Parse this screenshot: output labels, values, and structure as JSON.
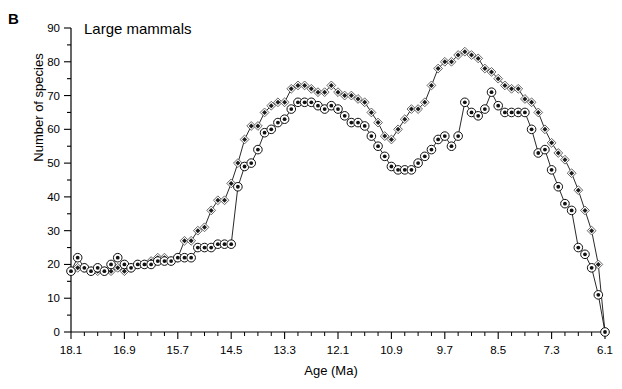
{
  "panel": {
    "label": "B"
  },
  "chart_data": {
    "type": "line",
    "title": "Large mammals",
    "xlabel": "Age (Ma)",
    "ylabel": "Number of species",
    "xlim": [
      18.1,
      6.1
    ],
    "ylim": [
      0,
      90
    ],
    "x_reversed": true,
    "grid": false,
    "legend_position": "none",
    "x_major_ticks": [
      "18.1",
      "16.9",
      "15.7",
      "14.5",
      "13.3",
      "12.1",
      "10.9",
      "9.7",
      "8.5",
      "7.3",
      "6.1"
    ],
    "x_major_values": [
      18.1,
      16.9,
      15.7,
      14.5,
      13.3,
      12.1,
      10.9,
      9.7,
      8.5,
      7.3,
      6.1
    ],
    "x_minor_step": 0.3,
    "y_major_ticks": [
      "0",
      "10",
      "20",
      "30",
      "40",
      "50",
      "60",
      "70",
      "80",
      "90"
    ],
    "y_major_values": [
      0,
      10,
      20,
      30,
      40,
      50,
      60,
      70,
      80,
      90
    ],
    "y_minor_step": 5,
    "x": [
      18.1,
      17.95,
      17.8,
      17.65,
      17.5,
      17.35,
      17.2,
      17.05,
      16.9,
      16.75,
      16.6,
      16.45,
      16.3,
      16.15,
      16.0,
      15.85,
      15.7,
      15.55,
      15.4,
      15.25,
      15.1,
      14.95,
      14.8,
      14.65,
      14.5,
      14.35,
      14.2,
      14.05,
      13.9,
      13.75,
      13.6,
      13.45,
      13.3,
      13.15,
      13.0,
      12.85,
      12.7,
      12.55,
      12.4,
      12.25,
      12.1,
      11.95,
      11.8,
      11.65,
      11.5,
      11.35,
      11.2,
      11.05,
      10.9,
      10.75,
      10.6,
      10.45,
      10.3,
      10.15,
      10.0,
      9.85,
      9.7,
      9.55,
      9.4,
      9.25,
      9.1,
      8.95,
      8.8,
      8.65,
      8.5,
      8.35,
      8.2,
      8.05,
      7.9,
      7.75,
      7.6,
      7.45,
      7.3,
      7.15,
      7.0,
      6.85,
      6.7,
      6.55,
      6.4,
      6.25,
      6.1
    ],
    "series": [
      {
        "name": "Total species (open diamond / filled diamond)",
        "marker": "diamond",
        "values": [
          18,
          19,
          19,
          18,
          18,
          18,
          18,
          19,
          18,
          19,
          20,
          20,
          21,
          22,
          22,
          21,
          22,
          27,
          27,
          30,
          31,
          36,
          39,
          39,
          44,
          50,
          57,
          61,
          61,
          65,
          67,
          68,
          68,
          72,
          73,
          73,
          72,
          71,
          71,
          73,
          71,
          70,
          70,
          69,
          68,
          65,
          62,
          58,
          57,
          60,
          63,
          66,
          66,
          68,
          73,
          78,
          80,
          80,
          82,
          83,
          82,
          81,
          78,
          77,
          75,
          73,
          72,
          72,
          69,
          68,
          65,
          60,
          56,
          53,
          51,
          47,
          42,
          36,
          30,
          20,
          0
        ]
      },
      {
        "name": "Species with minimum duration (open circle / dotted circle)",
        "marker": "circle",
        "values": [
          18,
          22,
          19,
          18,
          19,
          18,
          20,
          22,
          20,
          19,
          20,
          20,
          20,
          21,
          21,
          21,
          22,
          22,
          22,
          25,
          25,
          25,
          26,
          26,
          26,
          43,
          49,
          50,
          54,
          59,
          60,
          62,
          63,
          66,
          68,
          68,
          68,
          67,
          66,
          67,
          66,
          64,
          62,
          62,
          61,
          58,
          55,
          52,
          49,
          48,
          48,
          48,
          50,
          52,
          54,
          57,
          58,
          55,
          58,
          68,
          65,
          64,
          66,
          71,
          67,
          65,
          65,
          65,
          65,
          60,
          53,
          54,
          48,
          43,
          38,
          36,
          25,
          23,
          19,
          11,
          0
        ]
      }
    ]
  }
}
